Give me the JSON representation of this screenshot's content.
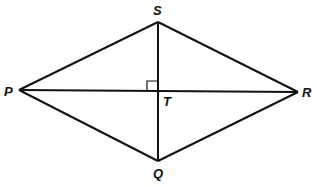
{
  "diagram": {
    "type": "rhombus-with-diagonals",
    "stroke_color": "#111111",
    "vertices": [
      {
        "name": "S",
        "x": 158,
        "y": 22,
        "label_x": 153,
        "label_y": 15
      },
      {
        "name": "R",
        "x": 298,
        "y": 92,
        "label_x": 302,
        "label_y": 97
      },
      {
        "name": "Q",
        "x": 158,
        "y": 161,
        "label_x": 153,
        "label_y": 178
      },
      {
        "name": "P",
        "x": 19,
        "y": 90,
        "label_x": 4,
        "label_y": 96
      }
    ],
    "intersection": {
      "name": "T",
      "x": 157,
      "y": 91,
      "label_x": 163,
      "label_y": 105
    },
    "right_angle_marker": {
      "x": 147,
      "y": 81,
      "size": 10
    },
    "labels": {
      "S": "S",
      "R": "R",
      "Q": "Q",
      "P": "P",
      "T": "T"
    }
  }
}
